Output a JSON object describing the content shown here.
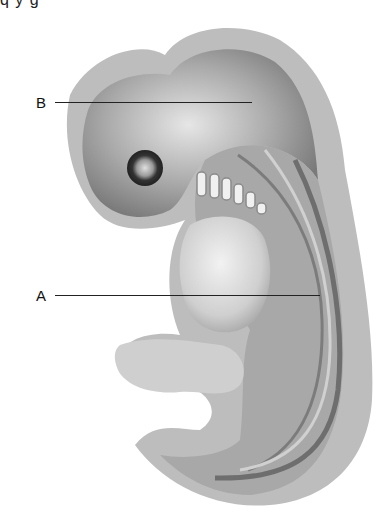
{
  "diagram": {
    "cropped_top_text": "q  y  g",
    "labels": [
      {
        "id": "B",
        "text": "B"
      },
      {
        "id": "A",
        "text": "A"
      }
    ],
    "colors": {
      "outer_membrane": "#b8b8b8",
      "body_light": "#d8d8d8",
      "body_dark": "#8a8a8a",
      "eye": "#444444",
      "leader_line": "#222222"
    }
  }
}
